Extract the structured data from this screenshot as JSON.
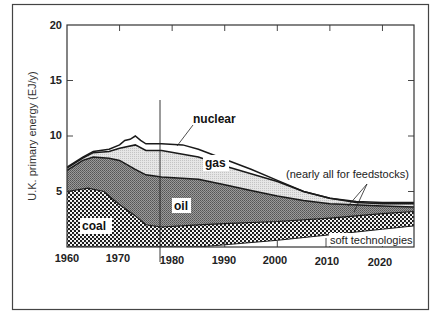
{
  "chart_data": {
    "type": "area",
    "title": "",
    "xlabel": "",
    "ylabel": "U.K. primary energy (EJ/y)",
    "xlim": [
      1960,
      2026
    ],
    "ylim": [
      0,
      20
    ],
    "grid": false,
    "x_ticks": [
      "1960",
      "1970",
      "1980",
      "1990",
      "2000",
      "2010",
      "2020"
    ],
    "y_ticks": [
      "5",
      "10",
      "15",
      "20"
    ],
    "reference_line_year": 1978,
    "stacking_order": [
      "soft technologies",
      "coal",
      "oil",
      "gas",
      "nuclear"
    ],
    "series": [
      {
        "name": "soft technologies",
        "fill": "white",
        "top_boundary": [
          [
            1960,
            0
          ],
          [
            1985,
            0
          ],
          [
            1990,
            0.2
          ],
          [
            2000,
            0.6
          ],
          [
            2010,
            1.1
          ],
          [
            2020,
            1.6
          ],
          [
            2026,
            1.9
          ]
        ]
      },
      {
        "name": "coal",
        "fill": "dotted",
        "top_boundary": [
          [
            1960,
            5.0
          ],
          [
            1964,
            5.3
          ],
          [
            1967,
            5.0
          ],
          [
            1970,
            3.8
          ],
          [
            1973,
            2.8
          ],
          [
            1975,
            2.0
          ],
          [
            1978,
            1.8
          ],
          [
            1985,
            2.0
          ],
          [
            1990,
            2.1
          ],
          [
            2000,
            2.3
          ],
          [
            2010,
            2.6
          ],
          [
            2020,
            3.0
          ],
          [
            2026,
            3.2
          ]
        ]
      },
      {
        "name": "oil",
        "fill": "dark-stipple",
        "top_boundary": [
          [
            1960,
            6.9
          ],
          [
            1963,
            7.8
          ],
          [
            1965,
            8.1
          ],
          [
            1968,
            8.0
          ],
          [
            1970,
            7.8
          ],
          [
            1973,
            7.0
          ],
          [
            1975,
            6.5
          ],
          [
            1978,
            6.3
          ],
          [
            1985,
            6.1
          ],
          [
            1990,
            5.6
          ],
          [
            1995,
            5.1
          ],
          [
            2000,
            4.6
          ],
          [
            2005,
            4.2
          ],
          [
            2010,
            3.9
          ],
          [
            2020,
            3.7
          ],
          [
            2026,
            3.6
          ]
        ]
      },
      {
        "name": "gas",
        "fill": "light-stipple",
        "top_boundary": [
          [
            1960,
            7.1
          ],
          [
            1963,
            8.0
          ],
          [
            1965,
            8.5
          ],
          [
            1968,
            8.6
          ],
          [
            1970,
            8.9
          ],
          [
            1973,
            9.2
          ],
          [
            1975,
            8.7
          ],
          [
            1978,
            8.7
          ],
          [
            1985,
            8.1
          ],
          [
            1990,
            7.3
          ],
          [
            1995,
            6.6
          ],
          [
            2000,
            5.9
          ],
          [
            2005,
            5.0
          ],
          [
            2010,
            4.4
          ],
          [
            2015,
            4.0
          ],
          [
            2020,
            3.9
          ],
          [
            2026,
            3.9
          ]
        ]
      },
      {
        "name": "nuclear",
        "fill": "white",
        "top_boundary": [
          [
            1960,
            7.2
          ],
          [
            1963,
            8.1
          ],
          [
            1965,
            8.6
          ],
          [
            1968,
            8.8
          ],
          [
            1970,
            9.2
          ],
          [
            1971,
            9.6
          ],
          [
            1972,
            9.7
          ],
          [
            1973,
            10.0
          ],
          [
            1974,
            9.6
          ],
          [
            1975,
            9.3
          ],
          [
            1978,
            9.3
          ],
          [
            1982,
            9.2
          ],
          [
            1985,
            8.8
          ],
          [
            1990,
            7.9
          ],
          [
            1995,
            7.0
          ],
          [
            2000,
            6.0
          ],
          [
            2005,
            5.0
          ],
          [
            2010,
            4.4
          ],
          [
            2015,
            4.1
          ],
          [
            2020,
            4.0
          ],
          [
            2026,
            4.0
          ]
        ]
      }
    ],
    "annotations": [
      {
        "text": "nuclear",
        "target": "nuclear band ~1980"
      },
      {
        "text": "gas"
      },
      {
        "text": "oil"
      },
      {
        "text": "coal"
      },
      {
        "text": "(nearly all for feedstocks)",
        "target": "oil and gas bands ~2015-2020"
      },
      {
        "text": "soft technologies"
      }
    ]
  },
  "labels": {
    "ylabel": "U.K. primary energy (EJ/y)",
    "x_ticks": [
      "1960",
      "1970",
      "1980",
      "1990",
      "2000",
      "2010",
      "2020"
    ],
    "y_ticks": [
      "5",
      "10",
      "15",
      "20"
    ],
    "nuclear": "nuclear",
    "gas": "gas",
    "oil": "oil",
    "coal": "coal",
    "feedstocks": "(nearly all for feedstocks)",
    "soft": "soft technologies"
  }
}
